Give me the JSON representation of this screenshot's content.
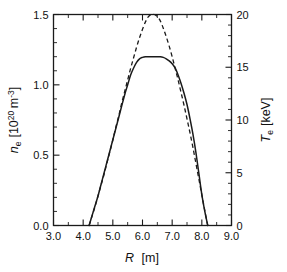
{
  "figure": {
    "title": "",
    "background": "#ffffff",
    "line_color": "#1a1a1a"
  },
  "axes": {
    "x": {
      "label_var": "R",
      "label_unit": "[m]",
      "min": 3.0,
      "max": 9.0,
      "major_ticks": [
        "3.0",
        "4.0",
        "5.0",
        "6.0",
        "7.0",
        "8.0",
        "9.0"
      ],
      "major_values": [
        3.0,
        4.0,
        5.0,
        6.0,
        7.0,
        8.0,
        9.0
      ],
      "minor_step": 0.5
    },
    "y_left": {
      "label_var": "n",
      "label_sub": "e",
      "label_unit_open": "[10",
      "label_unit_exp": "20",
      "label_unit_m": "m",
      "label_unit_mexp": "-3",
      "label_unit_close": "]",
      "min": 0.0,
      "max": 1.5,
      "major_ticks": [
        "0.0",
        "0.5",
        "1.0",
        "1.5"
      ],
      "major_values": [
        0.0,
        0.5,
        1.0,
        1.5
      ],
      "minor_step": 0.1
    },
    "y_right": {
      "label_var": "T",
      "label_sub": "e",
      "label_unit": "[keV]",
      "min": 0,
      "max": 20,
      "major_ticks": [
        "0",
        "5",
        "10",
        "15",
        "20"
      ],
      "major_values": [
        0,
        5,
        10,
        15,
        20
      ],
      "minor_step": 1
    }
  },
  "chart_data": {
    "type": "line",
    "title": "",
    "xlabel": "R [m]",
    "ylabel": "n_e [10^20 m^-3]",
    "ylabel_right": "T_e [keV]",
    "xlim": [
      3.0,
      9.0
    ],
    "ylim": [
      0.0,
      1.5
    ],
    "ylim_right": [
      0,
      20
    ],
    "grid": false,
    "legend": "none",
    "series": [
      {
        "name": "electron density n_e",
        "style": "solid",
        "axis": "left",
        "unit": "10^20 m^-3",
        "x": [
          4.2,
          4.3,
          4.4,
          4.5,
          4.6,
          4.7,
          4.8,
          4.9,
          5.0,
          5.1,
          5.2,
          5.3,
          5.4,
          5.5,
          5.6,
          5.7,
          5.8,
          5.9,
          6.0,
          6.1,
          6.2,
          6.3,
          6.4,
          6.5,
          6.6,
          6.7,
          6.8,
          6.9,
          7.0,
          7.1,
          7.2,
          7.3,
          7.4,
          7.5,
          7.6,
          7.7,
          7.8,
          7.9,
          8.0,
          8.1,
          8.2
        ],
        "y": [
          0.0,
          0.07,
          0.14,
          0.21,
          0.29,
          0.37,
          0.45,
          0.53,
          0.61,
          0.69,
          0.77,
          0.85,
          0.93,
          1.0,
          1.07,
          1.12,
          1.16,
          1.185,
          1.195,
          1.2,
          1.2,
          1.2,
          1.2,
          1.2,
          1.2,
          1.195,
          1.185,
          1.17,
          1.15,
          1.12,
          1.07,
          1.01,
          0.94,
          0.86,
          0.76,
          0.65,
          0.52,
          0.37,
          0.22,
          0.1,
          0.0
        ]
      },
      {
        "name": "electron temperature T_e",
        "style": "dashed",
        "axis": "right",
        "unit": "keV",
        "x": [
          4.2,
          4.3,
          4.4,
          4.5,
          4.6,
          4.7,
          4.8,
          4.9,
          5.0,
          5.1,
          5.2,
          5.3,
          5.4,
          5.5,
          5.6,
          5.7,
          5.8,
          5.9,
          6.0,
          6.1,
          6.2,
          6.3,
          6.4,
          6.5,
          6.6,
          6.7,
          6.8,
          6.9,
          7.0,
          7.1,
          7.2,
          7.3,
          7.4,
          7.5,
          7.6,
          7.7,
          7.8,
          7.9,
          8.0,
          8.1,
          8.2
        ],
        "y": [
          0.0,
          0.9,
          1.8,
          2.8,
          3.8,
          4.8,
          5.9,
          7.0,
          8.1,
          9.3,
          10.4,
          11.6,
          12.7,
          13.8,
          14.9,
          15.9,
          16.9,
          17.8,
          18.6,
          19.3,
          19.8,
          20.0,
          20.0,
          19.8,
          19.4,
          18.7,
          17.9,
          17.0,
          16.0,
          14.9,
          13.8,
          12.6,
          11.4,
          10.1,
          8.8,
          7.4,
          5.9,
          4.4,
          2.9,
          1.4,
          0.0
        ]
      }
    ],
    "annotations": {
      "density_peak_value": 1.2,
      "density_peak_position": 6.4,
      "temperature_peak_value": 20.0,
      "temperature_peak_position": 6.4,
      "edge_left": 4.2,
      "edge_right": 8.2
    }
  }
}
